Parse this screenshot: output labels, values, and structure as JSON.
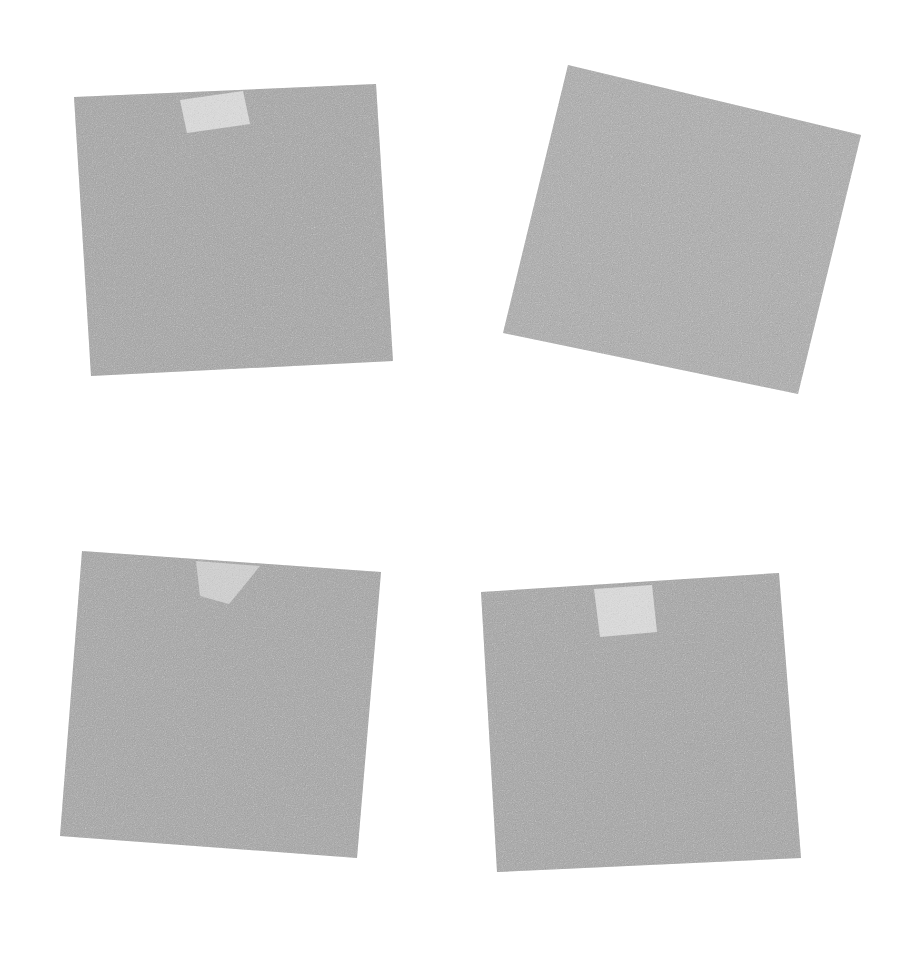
{
  "figure": {
    "type": "image-panel-grid",
    "width": 906,
    "height": 959,
    "background_color": "#ffffff",
    "layout": "2x2 grid of rotated square image patches on white background",
    "panel_count": 4,
    "colors": {
      "background": "#ffffff",
      "patch_fill": "#ababab",
      "patch_fill_light": "#b2b2b2",
      "highlight_fill": "#d9d9d9",
      "highlight_fill_soft": "#cfcfcf",
      "noise_light": "#c4c4c4",
      "noise_dark": "#9a9a9a"
    },
    "noise": {
      "description": "fine-grained monochrome speckle texture across every patch",
      "grain_opacity": 0.5,
      "grain_scale": 0.9
    }
  },
  "panels": [
    {
      "id": "panel-top-left",
      "name": "top-left-patch",
      "row": 1,
      "column": 1,
      "rotation_deg": -2.6,
      "fill": "#ababab",
      "corners": [
        {
          "x": 74,
          "y": 97
        },
        {
          "x": 376,
          "y": 84
        },
        {
          "x": 393,
          "y": 361
        },
        {
          "x": 91,
          "y": 376
        }
      ],
      "highlight": {
        "present": true,
        "name": "highlight-region-top-left",
        "shape": "rotated-rectangle",
        "fill": "#d9d9d9",
        "corners": [
          {
            "x": 180,
            "y": 100
          },
          {
            "x": 243,
            "y": 91
          },
          {
            "x": 250,
            "y": 124
          },
          {
            "x": 187,
            "y": 133
          }
        ]
      }
    },
    {
      "id": "panel-top-right",
      "name": "top-right-patch",
      "row": 1,
      "column": 2,
      "rotation_deg": 13.5,
      "fill": "#b0b0b0",
      "corners": [
        {
          "x": 568,
          "y": 65
        },
        {
          "x": 861,
          "y": 135
        },
        {
          "x": 798,
          "y": 394
        },
        {
          "x": 503,
          "y": 333
        }
      ],
      "highlight": {
        "present": false,
        "name": "highlight-region-top-right",
        "shape": "none",
        "fill": "#d9d9d9",
        "corners": []
      }
    },
    {
      "id": "panel-bottom-left",
      "name": "bottom-left-patch",
      "row": 2,
      "column": 1,
      "rotation_deg": 4.2,
      "fill": "#ababab",
      "corners": [
        {
          "x": 82,
          "y": 551
        },
        {
          "x": 381,
          "y": 572
        },
        {
          "x": 357,
          "y": 858
        },
        {
          "x": 60,
          "y": 836
        }
      ],
      "highlight": {
        "present": true,
        "name": "highlight-region-bottom-left",
        "shape": "wedge-triangle",
        "fill": "#cfcfcf",
        "corners": [
          {
            "x": 196,
            "y": 561
          },
          {
            "x": 260,
            "y": 566
          },
          {
            "x": 229,
            "y": 604
          },
          {
            "x": 200,
            "y": 596
          }
        ]
      }
    },
    {
      "id": "panel-bottom-right",
      "name": "bottom-right-patch",
      "row": 2,
      "column": 2,
      "rotation_deg": -3.2,
      "fill": "#ababab",
      "corners": [
        {
          "x": 481,
          "y": 592
        },
        {
          "x": 779,
          "y": 573
        },
        {
          "x": 801,
          "y": 858
        },
        {
          "x": 497,
          "y": 872
        }
      ],
      "highlight": {
        "present": true,
        "name": "highlight-region-bottom-right",
        "shape": "rotated-rectangle",
        "fill": "#d9d9d9",
        "corners": [
          {
            "x": 594,
            "y": 589
          },
          {
            "x": 652,
            "y": 585
          },
          {
            "x": 657,
            "y": 632
          },
          {
            "x": 600,
            "y": 637
          }
        ]
      }
    }
  ]
}
